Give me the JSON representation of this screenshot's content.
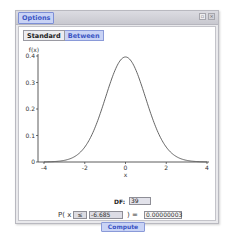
{
  "window": {
    "title": "Options",
    "buttons": {
      "restore_icon": "restore-icon",
      "close_icon": "close-icon"
    }
  },
  "mode_tabs": [
    {
      "label": "Standard",
      "active": false
    },
    {
      "label": "Between",
      "active": true
    }
  ],
  "chart_data": {
    "type": "line",
    "title": "",
    "distribution": "Student t",
    "xlabel": "x",
    "ylabel": "f(x)",
    "xlim": [
      -4.2,
      4.2
    ],
    "ylim": [
      0,
      0.4
    ],
    "x_ticks": [
      "-4",
      "-2",
      "0",
      "2",
      "4"
    ],
    "y_ticks": [
      "0",
      "0.1",
      "0.2",
      "0.3",
      "0.4"
    ],
    "grid": false,
    "series": [
      {
        "name": "t density (df=39)",
        "x": [
          -4,
          -3.5,
          -3,
          -2.5,
          -2,
          -1.5,
          -1,
          -0.5,
          0,
          0.5,
          1,
          1.5,
          2,
          2.5,
          3,
          3.5,
          4
        ],
        "y": [
          0.0003,
          0.0012,
          0.005,
          0.0186,
          0.0566,
          0.1308,
          0.241,
          0.3506,
          0.3964,
          0.3506,
          0.241,
          0.1308,
          0.0566,
          0.0186,
          0.005,
          0.0012,
          0.0003
        ]
      }
    ]
  },
  "controls": {
    "df_label": "DF:",
    "df_value": "39",
    "p_label": "P( x",
    "operator": "≤",
    "bound_value": "-6.685",
    "paren_eq": ") =",
    "result_value": "0.00000003",
    "compute_label": "Compute"
  },
  "colors": {
    "accent": "#c9d3f5",
    "accent_text": "#3b55c4",
    "curve": "#555555"
  }
}
